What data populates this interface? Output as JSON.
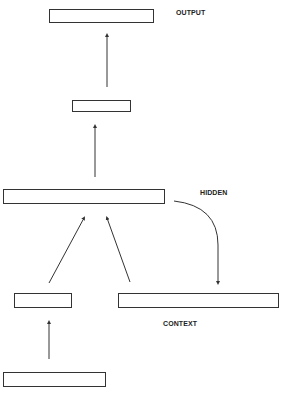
{
  "diagram": {
    "type": "simple recurrent network (Elman network)",
    "labels": {
      "output": "OUTPUT",
      "hidden": "HIDDEN",
      "context": "CONTEXT"
    },
    "nodes": [
      {
        "id": "output-layer",
        "label": "OUTPUT"
      },
      {
        "id": "output-projection",
        "label": ""
      },
      {
        "id": "hidden-layer",
        "label": "HIDDEN"
      },
      {
        "id": "input-projection",
        "label": ""
      },
      {
        "id": "context-layer",
        "label": "CONTEXT"
      },
      {
        "id": "input-layer",
        "label": ""
      }
    ],
    "edges": [
      {
        "from": "input-layer",
        "to": "input-projection"
      },
      {
        "from": "input-projection",
        "to": "hidden-layer"
      },
      {
        "from": "context-layer",
        "to": "hidden-layer"
      },
      {
        "from": "hidden-layer",
        "to": "context-layer",
        "style": "curved copy-back"
      },
      {
        "from": "hidden-layer",
        "to": "output-projection"
      },
      {
        "from": "output-projection",
        "to": "output-layer"
      }
    ],
    "colors": {
      "stroke": "#333333",
      "background": "#ffffff"
    }
  }
}
